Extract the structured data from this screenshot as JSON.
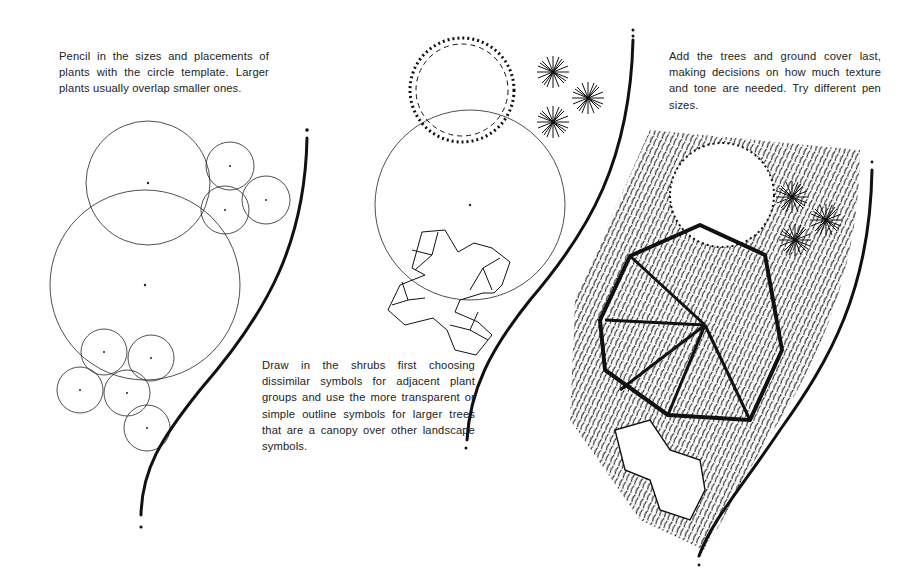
{
  "captions": {
    "step1": "Pencil in the sizes and placements of plants with the circle template. Larger plants usually overlap smaller ones.",
    "step2": "Draw in the shrubs first choosing dissimilar symbols for adjacent plant groups and use the more transparent or simple outline symbols for larger trees that are a canopy over other landscape symbols.",
    "step3": "Add the trees and ground cover last, making decisions on how much texture and tone are needed. Try different pen sizes."
  },
  "panels": [
    {
      "id": "panel-1",
      "label": "circle-template-layout",
      "circles": [
        {
          "cx": 148,
          "cy": 183,
          "r": 62
        },
        {
          "cx": 145,
          "cy": 285,
          "r": 95
        },
        {
          "cx": 230,
          "cy": 166,
          "r": 24
        },
        {
          "cx": 266,
          "cy": 200,
          "r": 24
        },
        {
          "cx": 225,
          "cy": 210,
          "r": 24
        },
        {
          "cx": 104,
          "cy": 352,
          "r": 23
        },
        {
          "cx": 151,
          "cy": 358,
          "r": 23
        },
        {
          "cx": 80,
          "cy": 390,
          "r": 23
        },
        {
          "cx": 127,
          "cy": 393,
          "r": 23
        },
        {
          "cx": 147,
          "cy": 428,
          "r": 23
        }
      ]
    },
    {
      "id": "panel-2",
      "label": "shrub-symbols"
    },
    {
      "id": "panel-3",
      "label": "final-rendered-plan"
    }
  ],
  "colors": {
    "ink": "#111111",
    "paper": "#ffffff"
  }
}
